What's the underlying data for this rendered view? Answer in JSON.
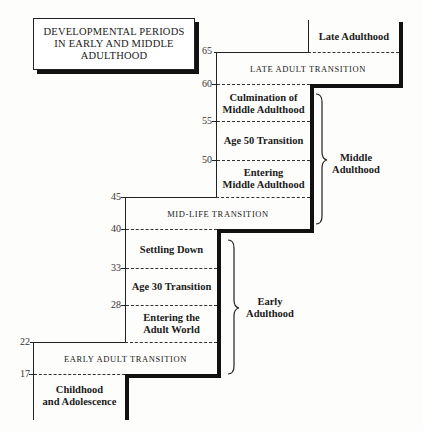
{
  "title": {
    "line1": "DEVELOPMENTAL PERIODS",
    "line2": "IN EARLY AND MIDDLE",
    "line3": "ADULTHOOD"
  },
  "ages": {
    "a65": "65",
    "a60": "60",
    "a55": "55",
    "a50": "50",
    "a45": "45",
    "a40": "40",
    "a33": "33",
    "a28": "28",
    "a22": "22",
    "a17": "17"
  },
  "periods": {
    "late_adulthood": "Late Adulthood",
    "late_adult_transition": "LATE ADULT TRANSITION",
    "culmination_line1": "Culmination of",
    "culmination_line2": "Middle Adulthood",
    "age50_transition": "Age 50 Transition",
    "entering_middle_line1": "Entering",
    "entering_middle_line2": "Middle Adulthood",
    "mid_life_transition": "MID-LIFE TRANSITION",
    "settling_down": "Settling Down",
    "age30_transition": "Age 30 Transition",
    "entering_adult_line1": "Entering the",
    "entering_adult_line2": "Adult World",
    "early_adult_transition": "EARLY ADULT TRANSITION",
    "childhood_line1": "Childhood",
    "childhood_line2": "and Adolescence"
  },
  "eras": {
    "middle_line1": "Middle",
    "middle_line2": "Adulthood",
    "early_line1": "Early",
    "early_line2": "Adulthood"
  }
}
